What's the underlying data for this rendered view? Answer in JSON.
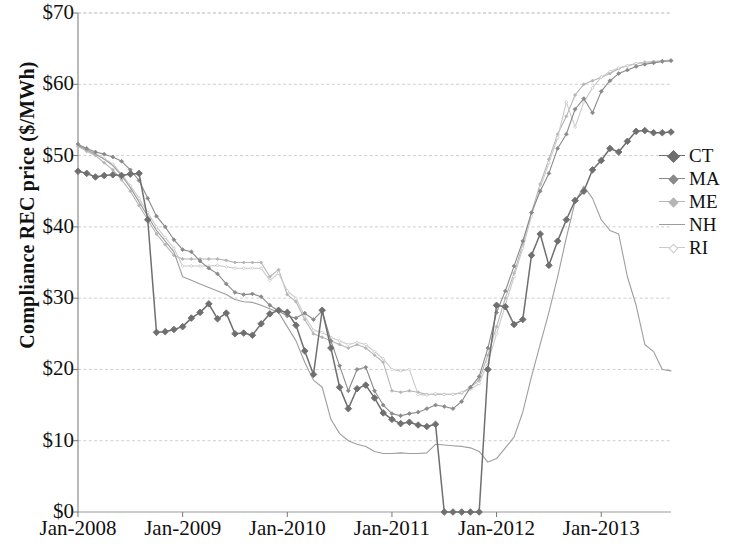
{
  "chart_data": {
    "type": "line",
    "title": "",
    "xlabel": "",
    "ylabel": "Compliance REC price ($/MWh)",
    "ylim": [
      0,
      70
    ],
    "ytick_labels": [
      "$0",
      "$10",
      "$20",
      "$30",
      "$40",
      "$50",
      "$60",
      "$70"
    ],
    "ytick_values": [
      0,
      10,
      20,
      30,
      40,
      50,
      60,
      70
    ],
    "xtick_labels": [
      "Jan-2008",
      "Jan-2009",
      "Jan-2010",
      "Jan-2011",
      "Jan-2012",
      "Jan-2013"
    ],
    "xtick_values": [
      0,
      12,
      24,
      36,
      48,
      60
    ],
    "x_index_range": [
      0,
      68
    ],
    "grid": "horizontal",
    "legend_position": "right",
    "legend_entries": [
      "CT",
      "MA",
      "ME",
      "NH",
      "RI"
    ],
    "series": [
      {
        "name": "CT",
        "color": "#6f6f6f",
        "marker": "diamond",
        "values": [
          47.8,
          47.5,
          47.0,
          47.2,
          47.3,
          47.2,
          47.4,
          47.5,
          41.0,
          25.2,
          25.3,
          25.6,
          26.0,
          27.2,
          28.0,
          29.2,
          27.1,
          27.9,
          25.0,
          25.1,
          24.8,
          26.4,
          27.8,
          28.3,
          28.0,
          26.2,
          22.6,
          19.3,
          28.3,
          23.0,
          17.5,
          14.5,
          17.3,
          17.8,
          16.0,
          13.9,
          13.0,
          12.4,
          12.6,
          12.2,
          12.0,
          12.3,
          0.0,
          0.0,
          0.0,
          0.0,
          0.0,
          20.0,
          29.0,
          28.8,
          26.3,
          27.0,
          36.0,
          39.0,
          34.6,
          38.0,
          41.0,
          43.7,
          45.0,
          48.0,
          49.3,
          51.0,
          50.5,
          52.0,
          53.4,
          53.5,
          53.2,
          53.2,
          53.3
        ]
      },
      {
        "name": "MA",
        "color": "#8a8a8a",
        "marker": "small",
        "values": [
          51.6,
          51.0,
          50.5,
          50.2,
          49.8,
          49.2,
          48.0,
          46.5,
          44.0,
          41.5,
          40.0,
          38.2,
          36.8,
          36.5,
          35.2,
          34.2,
          33.4,
          32.0,
          30.8,
          30.5,
          30.6,
          30.2,
          29.0,
          28.2,
          27.5,
          27.2,
          27.9,
          27.0,
          28.2,
          24.0,
          20.5,
          17.0,
          20.0,
          20.3,
          17.0,
          15.0,
          13.8,
          13.5,
          13.8,
          14.0,
          14.5,
          15.0,
          14.8,
          14.5,
          15.5,
          17.5,
          19.0,
          23.0,
          28.0,
          31.0,
          34.5,
          38.0,
          42.0,
          45.0,
          47.5,
          51.0,
          53.0,
          56.5,
          58.0,
          56.0,
          59.0,
          60.5,
          61.5,
          62.0,
          62.5,
          62.8,
          63.0,
          63.2,
          63.3
        ]
      },
      {
        "name": "ME",
        "color": "#b5b5b5",
        "marker": "tiny",
        "values": [
          51.3,
          50.6,
          50.0,
          49.0,
          48.0,
          46.6,
          45.0,
          43.0,
          41.0,
          39.0,
          37.5,
          36.0,
          35.5,
          35.5,
          35.5,
          35.5,
          35.5,
          35.3,
          35.0,
          35.0,
          35.0,
          35.0,
          33.0,
          34.0,
          30.5,
          29.5,
          27.0,
          25.0,
          24.5,
          24.0,
          23.5,
          23.0,
          23.5,
          23.0,
          22.0,
          21.0,
          17.0,
          16.8,
          17.0,
          16.8,
          16.5,
          16.5,
          16.5,
          16.5,
          16.7,
          17.5,
          18.5,
          22.0,
          26.0,
          30.0,
          33.5,
          37.5,
          42.0,
          46.0,
          49.5,
          53.0,
          55.5,
          58.5,
          60.0,
          60.5,
          61.0,
          61.5,
          62.2,
          62.6,
          62.9,
          63.1,
          63.2,
          63.3,
          63.4
        ]
      },
      {
        "name": "NH",
        "color": "#9e9e9e",
        "marker": "none",
        "values": [
          51.4,
          50.8,
          50.2,
          49.5,
          48.6,
          47.2,
          45.5,
          43.5,
          41.5,
          39.5,
          38.0,
          36.5,
          33.0,
          32.5,
          32.0,
          31.5,
          31.0,
          30.5,
          29.8,
          29.5,
          29.4,
          29.0,
          28.5,
          28.0,
          26.0,
          24.0,
          21.0,
          18.5,
          17.5,
          13.0,
          11.0,
          10.0,
          9.5,
          9.2,
          8.5,
          8.2,
          8.2,
          8.3,
          8.2,
          8.2,
          8.3,
          9.5,
          9.4,
          9.3,
          9.2,
          9.0,
          8.5,
          7.0,
          7.5,
          9.0,
          10.5,
          14.0,
          19.0,
          23.5,
          28.0,
          33.0,
          38.5,
          43.5,
          45.7,
          44.0,
          41.0,
          39.5,
          39.0,
          33.0,
          29.0,
          23.5,
          22.5,
          20.0,
          19.8
        ]
      },
      {
        "name": "RI",
        "color": "#cacaca",
        "marker": "tiny-open",
        "values": [
          51.5,
          50.9,
          50.3,
          49.6,
          48.8,
          47.4,
          45.8,
          44.0,
          42.0,
          40.0,
          38.5,
          37.0,
          34.5,
          34.5,
          34.5,
          34.5,
          34.6,
          34.4,
          34.2,
          34.2,
          34.2,
          34.2,
          32.5,
          33.5,
          31.0,
          30.0,
          27.5,
          25.5,
          25.2,
          24.5,
          24.0,
          23.5,
          23.8,
          23.5,
          22.5,
          21.5,
          20.0,
          19.8,
          20.0,
          16.5,
          16.4,
          16.6,
          16.5,
          16.5,
          16.8,
          17.2,
          18.0,
          21.0,
          25.0,
          29.0,
          33.0,
          37.0,
          41.5,
          45.5,
          49.0,
          52.5,
          57.5,
          54.0,
          57.5,
          59.5,
          61.0,
          61.8,
          62.3,
          62.6,
          62.9,
          63.0,
          63.1,
          63.2,
          63.3
        ]
      }
    ]
  },
  "axes": {
    "y_title": "Compliance REC price ($/MWh)"
  },
  "legend": {
    "items": [
      {
        "label": "CT"
      },
      {
        "label": "MA"
      },
      {
        "label": "ME"
      },
      {
        "label": "NH"
      },
      {
        "label": "RI"
      }
    ]
  }
}
